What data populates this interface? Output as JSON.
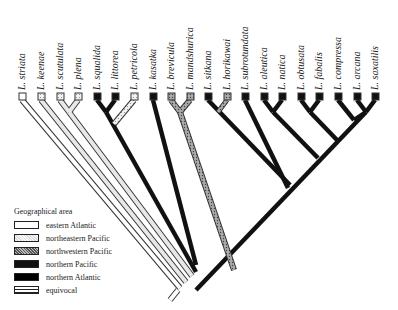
{
  "diagram": {
    "type": "phylogenetic-tree",
    "tips": [
      {
        "label": "L. striata",
        "area": "eastern Atlantic"
      },
      {
        "label": "L. keenae",
        "area": "northeastern Pacific"
      },
      {
        "label": "L. scutulata",
        "area": "northeastern Pacific"
      },
      {
        "label": "L. plena",
        "area": "northeastern Pacific"
      },
      {
        "label": "L. squalida",
        "area": "northern Pacific"
      },
      {
        "label": "L. littorea",
        "area": "northern Atlantic"
      },
      {
        "label": "L. petricola",
        "area": "northeastern Pacific"
      },
      {
        "label": "L. kasatka",
        "area": "northern Pacific"
      },
      {
        "label": "L. brevicula",
        "area": "northwestern Pacific"
      },
      {
        "label": "L. mandshurica",
        "area": "northwestern Pacific"
      },
      {
        "label": "L. sitkana",
        "area": "northern Pacific"
      },
      {
        "label": "L. horikawai",
        "area": "northwestern Pacific"
      },
      {
        "label": "L. subrotundata",
        "area": "northern Atlantic"
      },
      {
        "label": "L. aleutica",
        "area": "northern Pacific"
      },
      {
        "label": "L. natica",
        "area": "northern Pacific"
      },
      {
        "label": "L. obtusata",
        "area": "northern Atlantic"
      },
      {
        "label": "L. fabalis",
        "area": "northern Atlantic"
      },
      {
        "label": "L. compressa",
        "area": "northern Atlantic"
      },
      {
        "label": "L. arcana",
        "area": "northern Atlantic"
      },
      {
        "label": "L. saxatilis",
        "area": "northern Atlantic"
      }
    ]
  },
  "legend": {
    "title": "Geographical area",
    "items": [
      {
        "label": "eastern Atlantic",
        "style": "white"
      },
      {
        "label": "northeastern Pacific",
        "style": "light-stipple"
      },
      {
        "label": "northwestern Pacific",
        "style": "dark-stipple"
      },
      {
        "label": "northern Pacific",
        "style": "black"
      },
      {
        "label": "northern Atlantic",
        "style": "black"
      },
      {
        "label": "equivocal",
        "style": "horizontal-lines"
      }
    ]
  }
}
